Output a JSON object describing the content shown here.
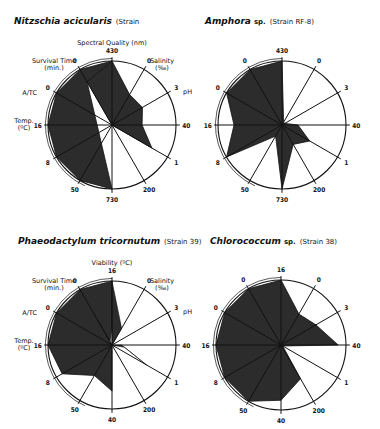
{
  "charts": [
    {
      "species": "Nitzschia acicularis",
      "strain_label": "(Strain",
      "top_axis_title": "Spectral Quality (nm)",
      "show_axis_titles": true
    },
    {
      "species": "Amphora",
      "species_suffix": "sp.",
      "strain_label": "(Strain RF-8)",
      "show_axis_titles": false
    },
    {
      "species": "Phaeodactylum tricornutum",
      "strain_label": "(Strain 39)",
      "top_axis_title": "Viability (ºC)",
      "show_axis_titles": true
    },
    {
      "species": "Chlorococcum",
      "species_suffix": "sp.",
      "strain_label": "(Strain 38)",
      "show_axis_titles": false
    }
  ],
  "axis_titles": {
    "survival": [
      "Survival Time",
      "(min.)"
    ],
    "atc": "A/TC",
    "temp": [
      "Temp.",
      "(ºC)"
    ],
    "salinity": [
      "Salinity",
      "(‰)"
    ],
    "ph": "pH"
  },
  "chart_data": [
    {
      "type": "radar",
      "title": "Nitzschia acicularis (Strain",
      "axes": [
        "Spectral Quality 430",
        "Salinity 0",
        "pH 3",
        "40",
        "1",
        "200",
        "730",
        "50",
        "Temp 8",
        "Temp 16",
        "A/TC 0",
        "Survival Time 0"
      ],
      "tick_labels": [
        "430",
        "0",
        "3",
        "40",
        "1",
        "200",
        "730",
        "50",
        "8",
        "16",
        "0",
        "0"
      ],
      "values": [
        1.0,
        0.55,
        0.55,
        0.47,
        0.72,
        0.0,
        1.0,
        1.0,
        1.0,
        1.0,
        1.0,
        1.0
      ],
      "notch_to_center_between": [
        "730",
        "Survival Time"
      ]
    },
    {
      "type": "radar",
      "title": "Amphora sp. (Strain RF-8)",
      "tick_labels": [
        "430",
        "0",
        "3",
        "40",
        "1",
        "200",
        "730",
        "50",
        "8",
        "16",
        "0",
        "0"
      ],
      "values": [
        1.0,
        0.05,
        0.05,
        0.25,
        0.5,
        0.35,
        1.0,
        0.2,
        1.0,
        0.75,
        1.0,
        1.0
      ]
    },
    {
      "type": "radar",
      "title": "Phaeodactylum tricornutum (Strain 39)",
      "tick_labels": [
        "16",
        "0",
        "3",
        "40",
        "1",
        "200",
        "40",
        "50",
        "8",
        "16",
        "0",
        "0"
      ],
      "values": [
        1.0,
        0.3,
        0.05,
        0.05,
        0.62,
        0.0,
        0.72,
        0.55,
        0.9,
        1.0,
        1.0,
        1.0
      ]
    },
    {
      "type": "radar",
      "title": "Chlorococcum sp. (Strain 38)",
      "tick_labels": [
        "16",
        "0",
        "3",
        "40",
        "1",
        "200",
        "40",
        "50",
        "8",
        "16",
        "0",
        "0"
      ],
      "values": [
        1.0,
        0.55,
        0.62,
        0.88,
        0.0,
        0.6,
        0.85,
        1.0,
        1.0,
        1.0,
        1.0,
        1.0
      ]
    }
  ],
  "style": {
    "fill": "#2c2c2c",
    "line": "#111111",
    "background": "#ffffff"
  }
}
